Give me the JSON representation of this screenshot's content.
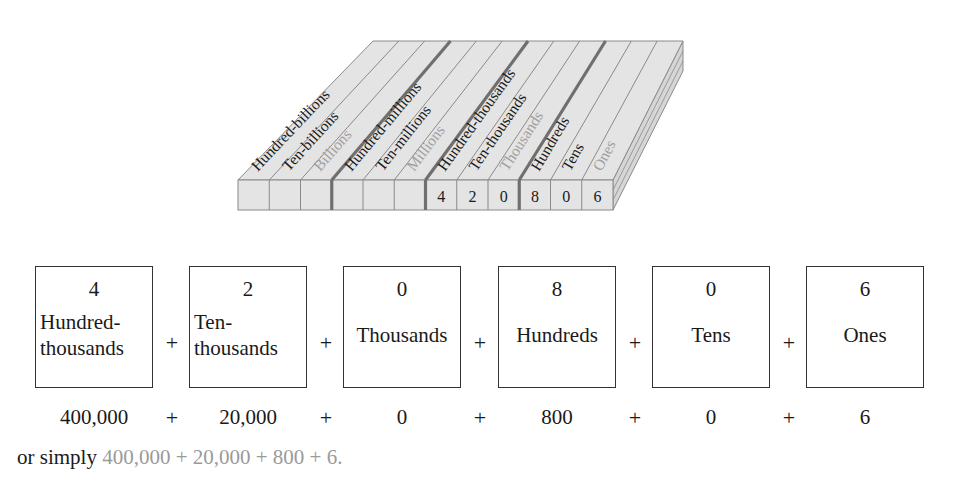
{
  "block": {
    "columns": [
      {
        "label": "Hundred-billions",
        "tone": "dark",
        "digit": ""
      },
      {
        "label": "Ten-billions",
        "tone": "dark",
        "digit": ""
      },
      {
        "label": "Billions",
        "tone": "light",
        "digit": ""
      },
      {
        "label": "Hundred-millions",
        "tone": "dark",
        "digit": ""
      },
      {
        "label": "Ten-millions",
        "tone": "dark",
        "digit": ""
      },
      {
        "label": "Millions",
        "tone": "light",
        "digit": ""
      },
      {
        "label": "Hundred-thousands",
        "tone": "dark",
        "digit": "4"
      },
      {
        "label": "Ten-thousands",
        "tone": "dark",
        "digit": "2"
      },
      {
        "label": "Thousands",
        "tone": "light",
        "digit": "0"
      },
      {
        "label": "Hundreds",
        "tone": "dark",
        "digit": "8"
      },
      {
        "label": "Tens",
        "tone": "dark",
        "digit": "0"
      },
      {
        "label": "Ones",
        "tone": "light",
        "digit": "6"
      }
    ],
    "colors": {
      "face": "#e4e4e4",
      "side": "#d6d6d6",
      "line": "#8a8a8a",
      "group_line": "#6f6f6f",
      "dark_label": "#1a1a1a",
      "light_label": "#a0a0a0"
    }
  },
  "expansion": {
    "boxes": [
      {
        "digit": "4",
        "name_line1": "Hundred-",
        "name_line2": "thousands",
        "value": "400,000"
      },
      {
        "digit": "2",
        "name_line1": "Ten-",
        "name_line2": "thousands",
        "value": "20,000"
      },
      {
        "digit": "0",
        "name_line1": "Thousands",
        "name_line2": "",
        "value": "0"
      },
      {
        "digit": "8",
        "name_line1": "Hundreds",
        "name_line2": "",
        "value": "800"
      },
      {
        "digit": "0",
        "name_line1": "Tens",
        "name_line2": "",
        "value": "0"
      },
      {
        "digit": "6",
        "name_line1": "Ones",
        "name_line2": "",
        "value": "6"
      }
    ],
    "plus": "+"
  },
  "simply": {
    "prefix": "or simply ",
    "expression": "400,000 + 20,000 + 800 + 6."
  }
}
